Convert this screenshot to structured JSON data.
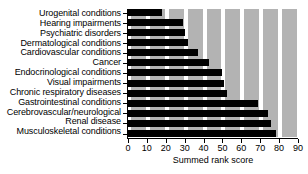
{
  "chart_data": {
    "type": "bar",
    "orientation": "horizontal",
    "title": "",
    "xlabel": "Summed rank score",
    "ylabel": "",
    "xlim": [
      0,
      90
    ],
    "xticks": [
      0,
      10,
      20,
      30,
      40,
      50,
      60,
      70,
      80,
      90
    ],
    "grid": "alternating vertical gray bands every 10 units",
    "legend": null,
    "bar_color": "#000000",
    "band_color": "#b3b3b3",
    "background_color": "#ffffff",
    "categories": [
      "Urogenital  conditions",
      "Hearing impairments",
      "Psychiatric disorders",
      "Dermatological conditions",
      "Cardiovascular conditions",
      "Cancer",
      "Endocrinological conditions",
      "Visual impairments",
      "Chronic respiratory diseases",
      "Gastrointestinal conditions",
      "Cerebrovascular/neurological",
      "Renal disease",
      "Musculoskeletal conditions"
    ],
    "values": [
      18,
      29,
      30,
      31.5,
      37,
      43,
      49.5,
      51,
      52.5,
      69,
      74,
      75.5,
      78.5
    ]
  }
}
